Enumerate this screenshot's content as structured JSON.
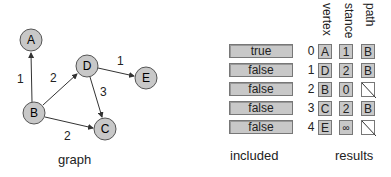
{
  "graph": {
    "caption": "graph",
    "nodes": [
      {
        "id": "A",
        "x": 31,
        "y": 40
      },
      {
        "id": "B",
        "x": 34,
        "y": 113
      },
      {
        "id": "C",
        "x": 105,
        "y": 129
      },
      {
        "id": "D",
        "x": 87,
        "y": 66
      },
      {
        "id": "E",
        "x": 146,
        "y": 78
      }
    ],
    "edges": [
      {
        "from": "B",
        "to": "A",
        "weight": "1"
      },
      {
        "from": "B",
        "to": "D",
        "weight": "2"
      },
      {
        "from": "B",
        "to": "C",
        "weight": "2"
      },
      {
        "from": "D",
        "to": "C",
        "weight": "3"
      },
      {
        "from": "D",
        "to": "E",
        "weight": "1"
      }
    ],
    "colors": {
      "node_fill": "#c8c8c8",
      "node_stroke": "#555555",
      "edge": "#333333"
    }
  },
  "included": {
    "caption": "included",
    "values": [
      "true",
      "false",
      "false",
      "false",
      "false"
    ]
  },
  "results": {
    "caption": "results",
    "headers": {
      "vertex": "vertex",
      "distance": "stance",
      "path": "path"
    },
    "indices": [
      "0",
      "1",
      "2",
      "3",
      "4"
    ],
    "vertex": [
      "A",
      "D",
      "B",
      "C",
      "E"
    ],
    "distance": [
      "1",
      "2",
      "0",
      "2",
      "∞"
    ],
    "path": [
      "B",
      "B",
      "",
      "B",
      ""
    ]
  }
}
